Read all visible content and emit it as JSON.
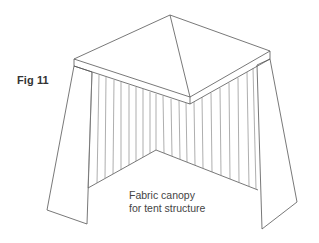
{
  "figure": {
    "label": "Fig 11",
    "caption_line1": "Fabric canopy",
    "caption_line2": "for tent structure",
    "stroke_color": "#555555"
  }
}
